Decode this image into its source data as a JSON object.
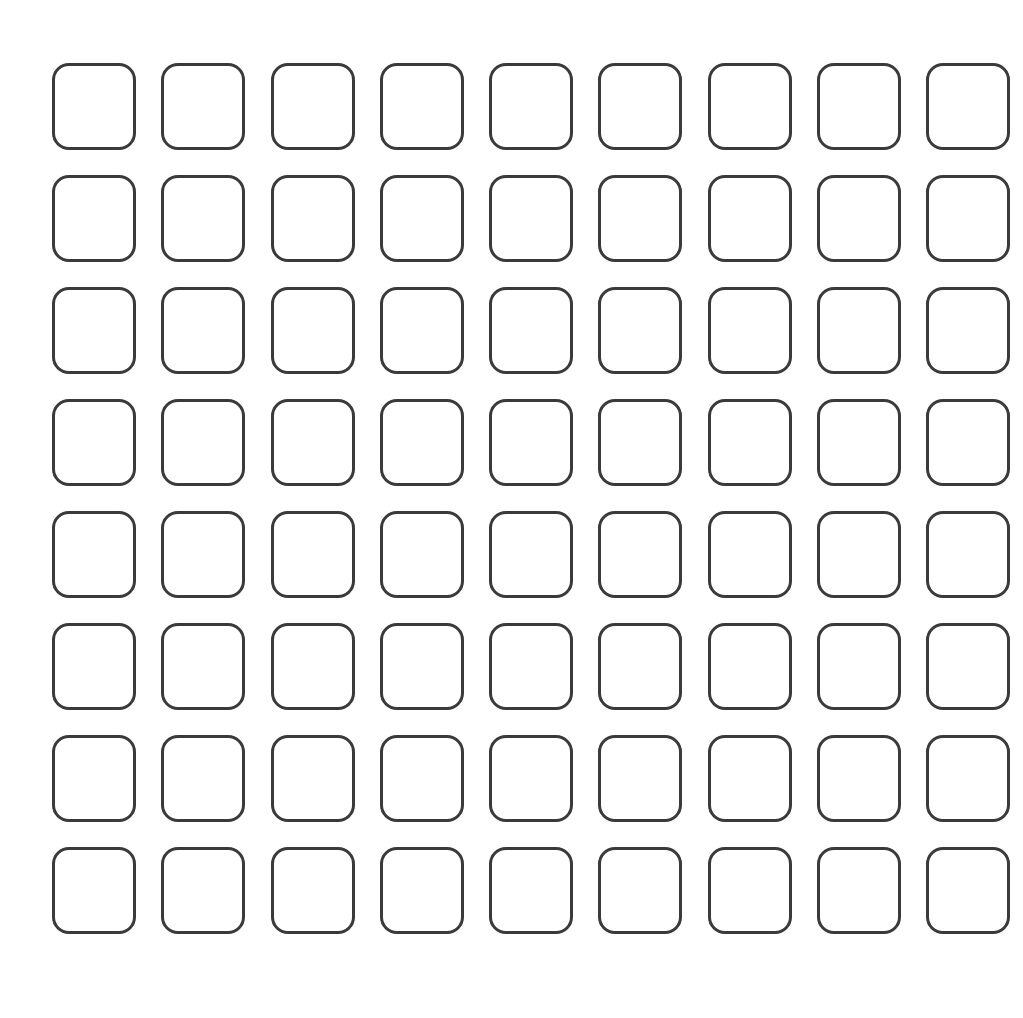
{
  "grid": {
    "rows": 8,
    "columns": 9,
    "cell_shape": "rounded-square-outline",
    "stroke_color": "#3a3a3a",
    "background_color": "#ffffff"
  }
}
